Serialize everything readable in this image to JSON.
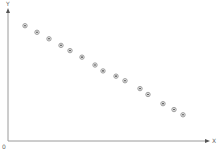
{
  "chart_data": {
    "type": "scatter",
    "title": "",
    "xlabel": "X",
    "ylabel": "Y",
    "origin_label": "0",
    "grid": false,
    "legend": null,
    "xlim": [
      0,
      100
    ],
    "ylim": [
      0,
      100
    ],
    "series": [
      {
        "name": "points",
        "marker": "circle-dot",
        "x": [
          8.5,
          14.5,
          20.5,
          26.5,
          31,
          37,
          43.5,
          47.5,
          54,
          58.5,
          66,
          70,
          77.5,
          83,
          87.5
        ],
        "y": [
          88,
          83,
          78,
          73,
          69,
          64,
          58,
          53.5,
          49.5,
          46,
          40,
          35.5,
          28.5,
          24,
          20
        ]
      }
    ]
  },
  "axes": {
    "x_label": "X",
    "y_label": "Y",
    "origin": "0"
  },
  "colors": {
    "axis": "#9a9a9a",
    "marker_ring": "#8c8c8c",
    "marker_dot": "#333333"
  }
}
